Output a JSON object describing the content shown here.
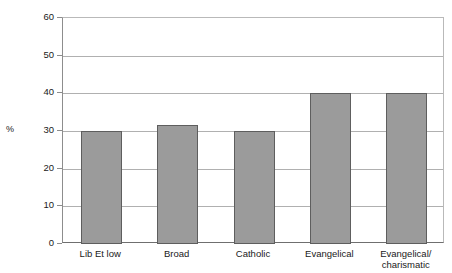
{
  "chart_data": {
    "type": "bar",
    "title": "",
    "xlabel": "",
    "ylabel": "%",
    "ylim": [
      0,
      60
    ],
    "yticks": [
      0,
      10,
      20,
      30,
      40,
      50,
      60
    ],
    "grid": true,
    "legend": null,
    "categories": [
      "Lib Et low",
      "Broad",
      "Catholic",
      "Evangelical",
      "Evangelical/\ncharismatic"
    ],
    "values": [
      30,
      31.5,
      30,
      40.2,
      40.2
    ],
    "bar_color": "#9b9b9b",
    "bar_edge_color": "#5e5e5e",
    "gridline_color": "#b0b0b0",
    "axis_color": "#6f6f6f"
  },
  "axis": {
    "y_title": "%",
    "tick_labels": [
      "60",
      "50",
      "40",
      "30",
      "20",
      "10",
      "0"
    ]
  },
  "bars": [
    {
      "label": "Lib Et low",
      "value": 30
    },
    {
      "label": "Broad",
      "value": 31.5
    },
    {
      "label": "Catholic",
      "value": 30
    },
    {
      "label": "Evangelical",
      "value": 40.2
    },
    {
      "label": "Evangelical/\ncharismatic",
      "value": 40.2
    }
  ]
}
